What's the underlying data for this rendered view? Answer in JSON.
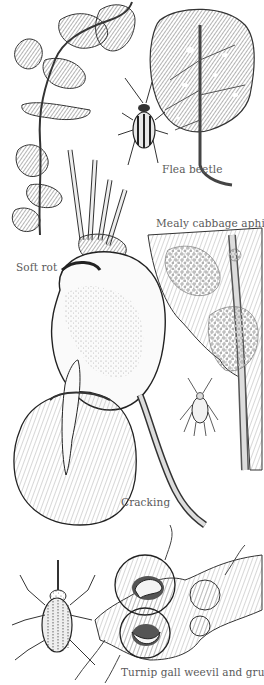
{
  "illustration": {
    "background": "#ffffff",
    "ink_color": "#2a2a2a",
    "label_color": "#5a5a5a",
    "labels": {
      "flea_beetle": "Flea beetle",
      "mealy_cabbage_aphid": "Mealy cabbage aphid",
      "soft_rot": "Soft rot",
      "cracking": "Cracking",
      "turnip_gall_weevil": "Turnip gall weevil and grubs"
    },
    "figures": [
      "damaged-leaf-stalk",
      "holed-leaf",
      "flea-beetle",
      "turnip-soft-rot",
      "aphid-colony-leaf",
      "aphid",
      "cracked-turnip",
      "turnip-gall-weevil",
      "galled-root-with-grubs"
    ]
  }
}
